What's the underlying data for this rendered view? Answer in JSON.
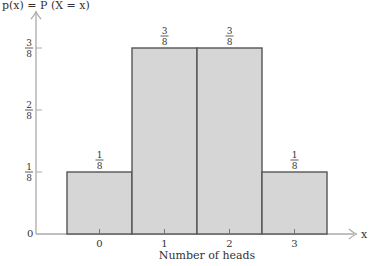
{
  "chart_data": {
    "type": "bar",
    "title": "",
    "ylabel": "p(x) = P (X = x)",
    "xlabel": "Number of heads",
    "x_axis_symbol": "x",
    "categories": [
      "0",
      "1",
      "2",
      "3"
    ],
    "values": [
      0.125,
      0.375,
      0.375,
      0.125
    ],
    "value_labels": [
      {
        "num": "1",
        "den": "8"
      },
      {
        "num": "3",
        "den": "8"
      },
      {
        "num": "3",
        "den": "8"
      },
      {
        "num": "1",
        "den": "8"
      }
    ],
    "y_ticks": [
      {
        "value": 0,
        "label": "0"
      },
      {
        "value": 0.125,
        "num": "1",
        "den": "8"
      },
      {
        "value": 0.25,
        "num": "2",
        "den": "8"
      },
      {
        "value": 0.375,
        "num": "3",
        "den": "8"
      }
    ],
    "ylim": [
      0,
      0.42
    ],
    "grid": false,
    "legend": null,
    "bar_width": 1,
    "colors": {
      "bar_fill": "#d6d6d6",
      "bar_edge": "#555555",
      "axis": "#aaaaaa",
      "text": "#333333"
    }
  },
  "labels": {
    "y_title": "p(x) = P (X = x)",
    "x_title": "Number of heads",
    "x_symbol": "x",
    "zero": "0"
  }
}
